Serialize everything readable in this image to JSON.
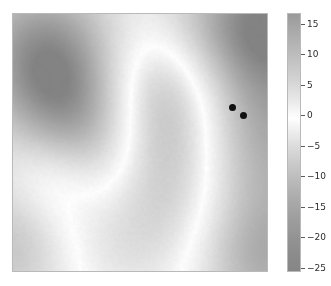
{
  "figure": {
    "title": "",
    "background_color": "#ffffff",
    "width": 331,
    "height": 286
  },
  "chart_data": {
    "type": "heatmap",
    "title": "",
    "xlabel": "",
    "ylabel": "",
    "colormap": "gray_reversed",
    "grid": false,
    "axis_ticks_visible": false,
    "xlim": [
      0,
      1
    ],
    "ylim": [
      0,
      1
    ],
    "vmin": -27.5,
    "vmax": 17.5,
    "colorbar": {
      "position": "right",
      "orientation": "vertical",
      "tick_values": [
        15,
        10,
        5,
        0,
        -5,
        -10,
        -15,
        -20,
        -25
      ],
      "tick_labels": [
        "15",
        "10",
        "5",
        "0",
        "−5",
        "−10",
        "−15",
        "−20",
        "−25"
      ],
      "tick_fractions": [
        0.0425,
        0.1585,
        0.2765,
        0.3935,
        0.5135,
        0.6295,
        0.7475,
        0.8635,
        0.983
      ]
    },
    "field_description": "Smooth 2D scalar field rendered in reversed grayscale; bright (white) region corresponds to values near 0 running diagonally through the centre, with darker lobes of higher magnitude in the upper-left, mid-left and along the right edge.",
    "field_blobs": [
      {
        "cx": 0.26,
        "cy": 0.42,
        "rx": 0.17,
        "ry": 0.27,
        "rot": -28,
        "amp": -22.0,
        "label": "upper-left-lobe"
      },
      {
        "cx": 0.16,
        "cy": 0.16,
        "rx": 0.22,
        "ry": 0.21,
        "rot": 0,
        "amp": -16.0,
        "label": "top-left-corner"
      },
      {
        "cx": 0.98,
        "cy": 0.33,
        "rx": 0.2,
        "ry": 0.45,
        "rot": 0,
        "amp": -20.0,
        "label": "right-edge-band"
      },
      {
        "cx": 0.88,
        "cy": 0.05,
        "rx": 0.3,
        "ry": 0.16,
        "rot": 0,
        "amp": -13.0,
        "label": "top-right-edge"
      },
      {
        "cx": 0.02,
        "cy": 0.88,
        "rx": 0.16,
        "ry": 0.2,
        "rot": 0,
        "amp": -12.0,
        "label": "bottom-left-corner"
      },
      {
        "cx": 0.98,
        "cy": 0.96,
        "rx": 0.17,
        "ry": 0.16,
        "rot": 0,
        "amp": -9.0,
        "label": "bottom-right-corner"
      },
      {
        "cx": 0.55,
        "cy": 0.17,
        "rx": 0.26,
        "ry": 0.22,
        "rot": 0,
        "amp": 11.0,
        "label": "top-centre-bright"
      },
      {
        "cx": 0.42,
        "cy": 0.72,
        "rx": 0.3,
        "ry": 0.3,
        "rot": 0,
        "amp": 13.0,
        "label": "lower-centre-bright"
      },
      {
        "cx": 0.63,
        "cy": 0.48,
        "rx": 0.22,
        "ry": 0.3,
        "rot": 0,
        "amp": 9.0,
        "label": "centre-right-bright"
      },
      {
        "cx": 0.14,
        "cy": 0.64,
        "rx": 0.13,
        "ry": 0.14,
        "rot": 0,
        "amp": 7.0,
        "label": "left-bright"
      }
    ],
    "scatter_points": [
      {
        "name": "point-1",
        "x": 0.8555,
        "y": 0.6371,
        "color": "#101010",
        "size": 7
      },
      {
        "name": "point-2",
        "x": 0.9023,
        "y": 0.61,
        "color": "#101010",
        "size": 7
      }
    ]
  }
}
